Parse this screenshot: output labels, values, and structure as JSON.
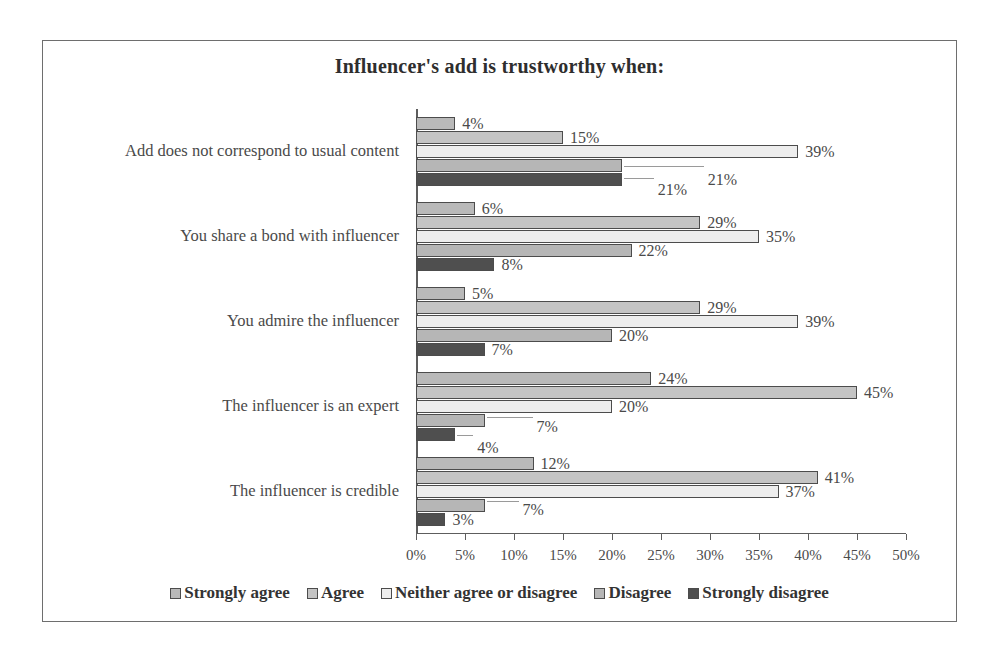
{
  "chart_data": {
    "type": "bar",
    "orientation": "horizontal",
    "title": "Influencer's add is trustworthy when:",
    "xlabel": "",
    "ylabel": "",
    "xlim": [
      0,
      50
    ],
    "xtick_labels": [
      "0%",
      "5%",
      "10%",
      "15%",
      "20%",
      "25%",
      "30%",
      "35%",
      "40%",
      "45%",
      "50%"
    ],
    "xtick_values": [
      0,
      5,
      10,
      15,
      20,
      25,
      30,
      35,
      40,
      45,
      50
    ],
    "grid": false,
    "legend_position": "bottom",
    "categories": [
      "Add does not correspond to usual content",
      "You share a bond with influencer",
      "You admire the influencer",
      "The influencer is an expert",
      "The influencer is credible"
    ],
    "series": [
      {
        "name": "Strongly agree",
        "color": "#b9b9b9",
        "values": [
          4,
          6,
          5,
          24,
          12
        ],
        "labels": [
          "4%",
          "6%",
          "5%",
          "24%",
          "12%"
        ]
      },
      {
        "name": "Agree",
        "color": "#c4c4c4",
        "values": [
          15,
          29,
          29,
          45,
          41
        ],
        "labels": [
          "15%",
          "29%",
          "29%",
          "45%",
          "41%"
        ]
      },
      {
        "name": "Neither agree or disagree",
        "color": "#ededed",
        "values": [
          39,
          35,
          39,
          20,
          37
        ],
        "labels": [
          "39%",
          "35%",
          "39%",
          "20%",
          "37%"
        ]
      },
      {
        "name": "Disagree",
        "color": "#b6b6b6",
        "values": [
          21,
          22,
          20,
          7,
          7
        ],
        "labels": [
          "21%",
          "22%",
          "20%",
          "7%",
          "7%"
        ]
      },
      {
        "name": "Strongly disagree",
        "color": "#4f4f4f",
        "values": [
          21,
          8,
          7,
          4,
          3
        ],
        "labels": [
          "21%",
          "8%",
          "7%",
          "4%",
          "3%"
        ]
      }
    ]
  }
}
